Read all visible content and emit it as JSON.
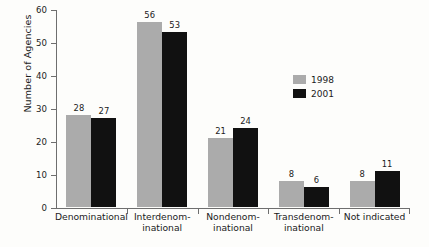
{
  "chart_data": {
    "type": "bar",
    "title": "",
    "xlabel": "",
    "ylabel": "Number of Agencies",
    "ylim": [
      0,
      60
    ],
    "yticks": [
      0,
      10,
      20,
      30,
      40,
      50,
      60
    ],
    "grid": false,
    "legend_position": "upper-right-inside",
    "categories": [
      "Denominational",
      "Interdenominational",
      "Nondenominational",
      "Transdenominational",
      "Not indicated"
    ],
    "category_label_lines": [
      [
        "Denominational"
      ],
      [
        "Interdenom-",
        "inational"
      ],
      [
        "Nondenom-",
        "inational"
      ],
      [
        "Transdenom-",
        "inational"
      ],
      [
        "Not indicated"
      ]
    ],
    "series": [
      {
        "name": "1998",
        "color": "#ababab",
        "values": [
          28,
          56,
          21,
          8,
          8
        ]
      },
      {
        "name": "2001",
        "color": "#111111",
        "values": [
          27,
          53,
          24,
          6,
          11
        ]
      }
    ]
  },
  "legend": {
    "items": [
      {
        "label": "1998"
      },
      {
        "label": "2001"
      }
    ]
  },
  "axis": {
    "y_title": "Number of Agencies",
    "y_tick_labels": [
      "60",
      "50",
      "40",
      "30",
      "20",
      "10",
      "0"
    ]
  }
}
